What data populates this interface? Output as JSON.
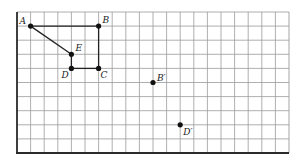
{
  "grid": {
    "columns": 20,
    "rows": 10,
    "origin_px": [
      17,
      12
    ],
    "cell_w": 13.6,
    "cell_h": 14.1,
    "line_color": "#9a9a9a",
    "axis_color": "#2a2a2a"
  },
  "points": [
    {
      "id": "A",
      "label": "A",
      "col": 1,
      "row": 1,
      "label_dx": -11,
      "label_dy": -2
    },
    {
      "id": "B",
      "label": "B",
      "col": 6,
      "row": 1,
      "label_dx": 4,
      "label_dy": -3
    },
    {
      "id": "E",
      "label": "E",
      "col": 4,
      "row": 3,
      "label_dx": 4,
      "label_dy": -3
    },
    {
      "id": "D",
      "label": "D",
      "col": 4,
      "row": 4,
      "label_dx": -10,
      "label_dy": 10
    },
    {
      "id": "C",
      "label": "C",
      "col": 6,
      "row": 4,
      "label_dx": 2,
      "label_dy": 10
    },
    {
      "id": "Bp",
      "label": "B′",
      "col": 10,
      "row": 5,
      "label_dx": 4,
      "label_dy": -2
    },
    {
      "id": "Dp",
      "label": "D′",
      "col": 12,
      "row": 8,
      "label_dx": 3,
      "label_dy": 10
    }
  ],
  "segments": [
    [
      "A",
      "B"
    ],
    [
      "B",
      "C"
    ],
    [
      "C",
      "D"
    ],
    [
      "D",
      "E"
    ],
    [
      "E",
      "A"
    ]
  ],
  "point_color": "#111111",
  "segment_color": "#222222"
}
